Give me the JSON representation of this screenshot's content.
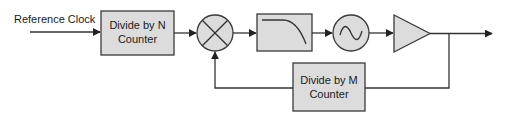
{
  "diagram": {
    "input": {
      "label": "Reference Clock"
    },
    "blocks": [
      {
        "id": "divide_n",
        "line1": "Divide by N",
        "line2": "Counter",
        "type": "box"
      },
      {
        "id": "mixer",
        "type": "phase-detector-mixer",
        "symbol": "multiply-cross-circle"
      },
      {
        "id": "lpf",
        "type": "low-pass-filter",
        "symbol": "rolloff-curve"
      },
      {
        "id": "vco",
        "type": "voltage-controlled-oscillator",
        "symbol": "sine-wave-circle"
      },
      {
        "id": "amp",
        "type": "amplifier",
        "symbol": "triangle"
      },
      {
        "id": "divide_m",
        "line1": "Divide by M",
        "line2": "Counter",
        "type": "box"
      }
    ],
    "connections": [
      [
        "input",
        "divide_n"
      ],
      [
        "divide_n",
        "mixer"
      ],
      [
        "mixer",
        "lpf"
      ],
      [
        "lpf",
        "vco"
      ],
      [
        "vco",
        "amp"
      ],
      [
        "amp",
        "output"
      ],
      [
        "amp",
        "divide_m"
      ],
      [
        "divide_m",
        "mixer"
      ]
    ],
    "colors": {
      "block_fill": "#dcdcdc",
      "stroke": "#333333",
      "text": "#1a1a1a"
    }
  }
}
